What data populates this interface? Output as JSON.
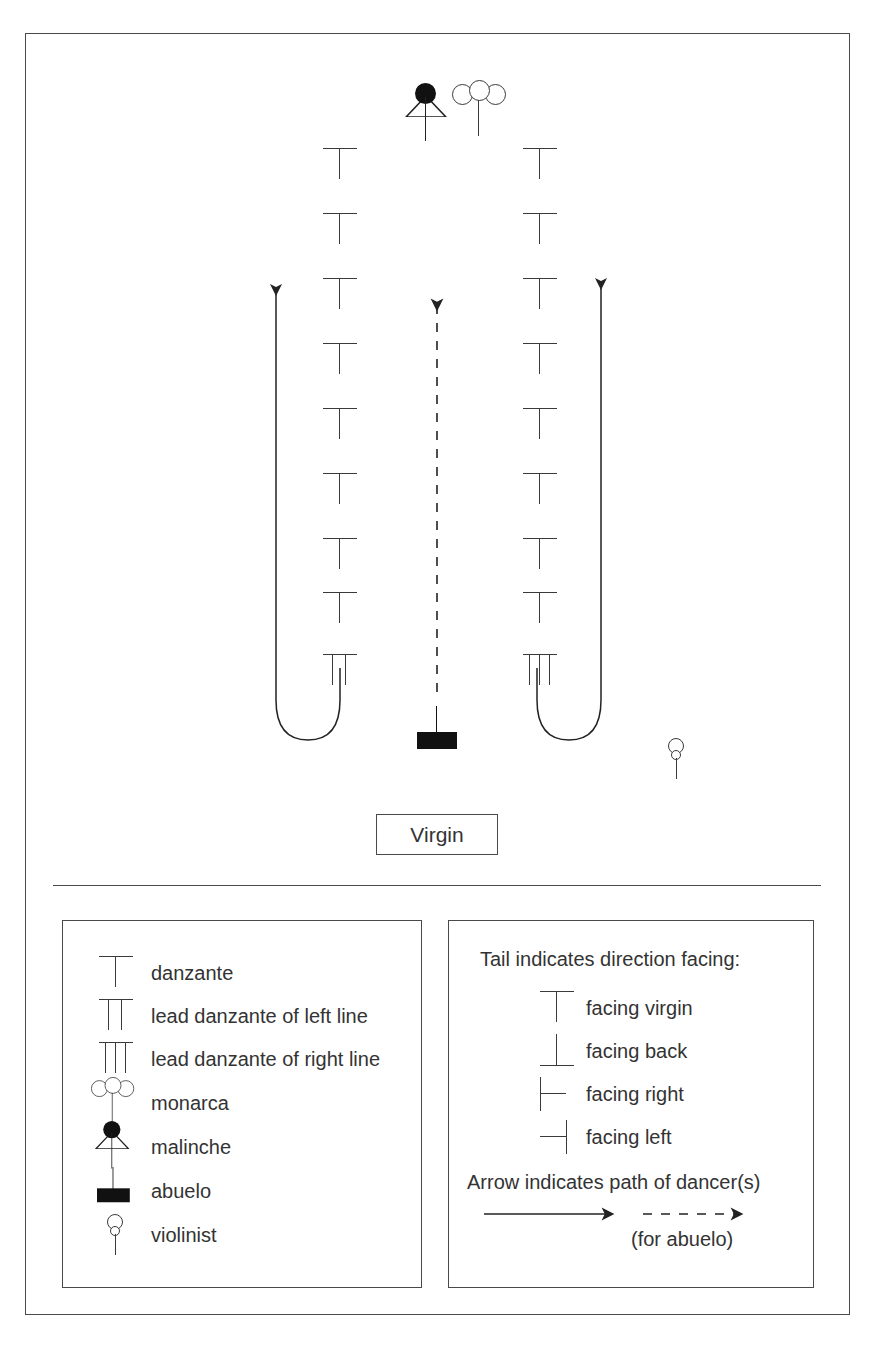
{
  "diagram": {
    "stage": {
      "virgin_label": "Virgin",
      "left_line": {
        "count": 9,
        "positions_y": [
          150,
          215,
          281,
          346,
          411,
          476,
          541,
          606,
          658
        ],
        "x": 323,
        "facing": "virgin",
        "lead_at_bottom": "lead danzante of left line",
        "lead_stems": 2
      },
      "right_line": {
        "count": 9,
        "positions_y": [
          150,
          215,
          281,
          346,
          411,
          476,
          541,
          606,
          658
        ],
        "x": 523,
        "facing": "virgin",
        "lead_at_bottom": "lead danzante of right line",
        "lead_stems": 3
      },
      "monarca": {
        "x": 452,
        "y": 82
      },
      "malinche": {
        "x": 405,
        "y": 83
      },
      "abuelo": {
        "x": 415,
        "y": 705
      },
      "violinist": {
        "x": 664,
        "y": 738
      },
      "paths": [
        {
          "name": "left-line-path",
          "style": "solid",
          "direction": "up"
        },
        {
          "name": "right-line-path",
          "style": "solid",
          "direction": "up"
        },
        {
          "name": "abuelo-path",
          "style": "dashed",
          "direction": "up"
        }
      ]
    }
  },
  "legend_symbols": {
    "heading": "",
    "items": [
      {
        "glyph": "danzante-icon",
        "label": "danzante"
      },
      {
        "glyph": "lead-danzante-left-icon",
        "label": "lead danzante of left line"
      },
      {
        "glyph": "lead-danzante-right-icon",
        "label": "lead danzante of right line"
      },
      {
        "glyph": "monarca-icon",
        "label": "monarca"
      },
      {
        "glyph": "malinche-icon",
        "label": "malinche"
      },
      {
        "glyph": "abuelo-icon",
        "label": "abuelo"
      },
      {
        "glyph": "violinist-icon",
        "label": "violinist"
      }
    ]
  },
  "legend_direction": {
    "heading": "Tail indicates direction facing:",
    "items": [
      {
        "glyph": "facing-virgin-icon",
        "label": "facing virgin"
      },
      {
        "glyph": "facing-back-icon",
        "label": "facing back"
      },
      {
        "glyph": "facing-right-icon",
        "label": "facing right"
      },
      {
        "glyph": "facing-left-icon",
        "label": "facing left"
      }
    ],
    "arrow_heading": "Arrow indicates path of dancer(s)",
    "dashed_note": "(for abuelo)"
  },
  "colors": {
    "line": "#3a3a3a",
    "frame": "#4a4a4a",
    "fill_dark": "#111111",
    "text": "#333333",
    "background": "#ffffff"
  }
}
